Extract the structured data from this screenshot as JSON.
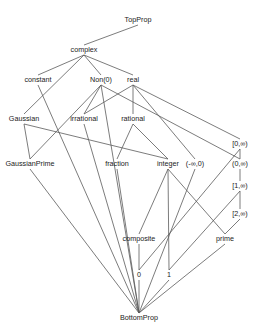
{
  "diagram": {
    "nodes": [
      {
        "id": "TopProp",
        "label": "TopProp",
        "x": 138,
        "y": 22
      },
      {
        "id": "complex",
        "label": "complex",
        "x": 84,
        "y": 52
      },
      {
        "id": "constant",
        "label": "constant",
        "x": 38,
        "y": 82
      },
      {
        "id": "Non0",
        "label": "Non(0)",
        "x": 101,
        "y": 82
      },
      {
        "id": "real",
        "label": "real",
        "x": 133,
        "y": 82
      },
      {
        "id": "Gaussian",
        "label": "Gaussian",
        "x": 24,
        "y": 121
      },
      {
        "id": "irrational",
        "label": "irrational",
        "x": 84,
        "y": 121
      },
      {
        "id": "rational",
        "label": "rational",
        "x": 133,
        "y": 121
      },
      {
        "id": "zeroInfClosed",
        "label": "[0,∞)",
        "x": 240,
        "y": 146
      },
      {
        "id": "GaussianPrime",
        "label": "GaussianPrime",
        "x": 30,
        "y": 166
      },
      {
        "id": "fraction",
        "label": "fraction",
        "x": 117,
        "y": 166
      },
      {
        "id": "integer",
        "label": "integer",
        "x": 168,
        "y": 166
      },
      {
        "id": "negInfZero",
        "label": "(-∞,0)",
        "x": 195,
        "y": 166
      },
      {
        "id": "zeroInfOpen",
        "label": "(0,∞)",
        "x": 240,
        "y": 166
      },
      {
        "id": "oneInf",
        "label": "[1,∞)",
        "x": 240,
        "y": 188
      },
      {
        "id": "twoInf",
        "label": "[2,∞)",
        "x": 240,
        "y": 216
      },
      {
        "id": "composite",
        "label": "composite",
        "x": 139,
        "y": 241
      },
      {
        "id": "prime",
        "label": "prime",
        "x": 225,
        "y": 241
      },
      {
        "id": "zero",
        "label": "0",
        "x": 139,
        "y": 277
      },
      {
        "id": "one",
        "label": "1",
        "x": 169,
        "y": 277
      },
      {
        "id": "BottomProp",
        "label": "BottomProp",
        "x": 139,
        "y": 320
      }
    ],
    "edges": [
      [
        "TopProp",
        "complex"
      ],
      [
        "complex",
        "constant"
      ],
      [
        "complex",
        "Gaussian"
      ],
      [
        "complex",
        "Non0"
      ],
      [
        "complex",
        "real"
      ],
      [
        "constant",
        "BottomProp"
      ],
      [
        "Non0",
        "irrational"
      ],
      [
        "Non0",
        "GaussianPrime"
      ],
      [
        "Non0",
        "zeroInfOpen"
      ],
      [
        "Non0",
        "BottomProp"
      ],
      [
        "real",
        "irrational"
      ],
      [
        "real",
        "rational"
      ],
      [
        "real",
        "negInfZero"
      ],
      [
        "real",
        "zeroInfClosed"
      ],
      [
        "Gaussian",
        "GaussianPrime"
      ],
      [
        "Gaussian",
        "integer"
      ],
      [
        "irrational",
        "BottomProp"
      ],
      [
        "rational",
        "fraction"
      ],
      [
        "rational",
        "integer"
      ],
      [
        "GaussianPrime",
        "BottomProp"
      ],
      [
        "fraction",
        "BottomProp"
      ],
      [
        "integer",
        "composite"
      ],
      [
        "integer",
        "one"
      ],
      [
        "integer",
        "prime"
      ],
      [
        "negInfZero",
        "BottomProp"
      ],
      [
        "zeroInfClosed",
        "zeroInfOpen"
      ],
      [
        "zeroInfClosed",
        "zero"
      ],
      [
        "zeroInfOpen",
        "oneInf"
      ],
      [
        "oneInf",
        "twoInf"
      ],
      [
        "oneInf",
        "one"
      ],
      [
        "twoInf",
        "prime"
      ],
      [
        "composite",
        "zero"
      ],
      [
        "zero",
        "BottomProp"
      ],
      [
        "one",
        "BottomProp"
      ],
      [
        "prime",
        "BottomProp"
      ]
    ]
  }
}
